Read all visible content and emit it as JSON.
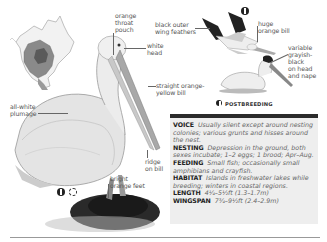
{
  "labels": {
    "throat_pouch": "orange\nthroat\npouch",
    "white_head": "white\nhead",
    "wing_feathers": "black outer\nwing feathers",
    "huge_bill": "huge\norange bill",
    "variable_head": "variable\ngrayish-\nblack\non head\nand nape",
    "straight_bill": "straight orange-\nyellow bill",
    "plumage": "all-white\nplumage",
    "ridge": "ridge\non bill",
    "feet": "bright\norange feet"
  },
  "postbreeding_label": "POSTBREEDING",
  "symbols": {
    "breeding_icon": "breeding-symbol-icon",
    "sun_icon": "summer-sun-icon"
  },
  "info": {
    "entries": [
      {
        "key": "VOICE",
        "value": "Usually silent except around nesting colonies; various grunts and hisses around the nest."
      },
      {
        "key": "NESTING",
        "value": "Depression in the ground, both sexes incubate; 1–2 eggs; 1 brood; Apr–Aug."
      },
      {
        "key": "FEEDING",
        "value": "Small fish; occasionally small amphibians and crayfish."
      },
      {
        "key": "HABITAT",
        "value": "Islands in freshwater lakes while breeding; winters in coastal regions."
      },
      {
        "key": "LENGTH",
        "value": "4¼–5½ft (1.3–1.7m)"
      },
      {
        "key": "WINGSPAN",
        "value": "7¾–9½ft (2.4–2.9m)"
      }
    ]
  },
  "colors": {
    "info_bg": "#eeeeee",
    "info_bar": "#2b2b2b",
    "text": "#444444"
  }
}
